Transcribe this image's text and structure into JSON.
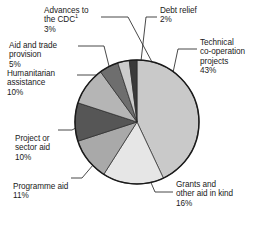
{
  "figure": {
    "background": "#ffffff",
    "outline_color": "#1a1a1a",
    "leader_color": "#1a1a1a"
  },
  "chart_data": {
    "type": "pie",
    "title": "",
    "subtitle": "",
    "xlabel": "",
    "ylabel": "",
    "grid": false,
    "legend_position": "none",
    "label_format": "name + percent",
    "start_angle_deg": 0,
    "direction": "clockwise",
    "center": {
      "x": 137,
      "y": 122
    },
    "radius": 62,
    "categories": [
      "Technical co-operation projects",
      "Grants and other aid in kind",
      "Programme aid",
      "Project or sector aid",
      "Humanitarian assistance",
      "Aid and trade provision",
      "Advances to the CDC",
      "Debt relief"
    ],
    "values": [
      43,
      16,
      11,
      10,
      10,
      5,
      3,
      2
    ],
    "value_labels": [
      "43%",
      "16%",
      "11%",
      "10%",
      "10%",
      "5%",
      "3%",
      "2%"
    ],
    "colors": [
      "#c9c9c9",
      "#e6e6e6",
      "#a9a9a9",
      "#565656",
      "#b5b5b5",
      "#6e6e6e",
      "#cccccc",
      "#3a3a3a"
    ],
    "total": 100,
    "slices": [
      {
        "name": "Technical co-operation projects",
        "value": 43,
        "label": "43%",
        "color": "#c9c9c9"
      },
      {
        "name": "Grants and other aid in kind",
        "value": 16,
        "label": "16%",
        "color": "#e6e6e6"
      },
      {
        "name": "Programme aid",
        "value": 11,
        "label": "11%",
        "color": "#a9a9a9"
      },
      {
        "name": "Project or sector aid",
        "value": 10,
        "label": "10%",
        "color": "#565656"
      },
      {
        "name": "Humanitarian assistance",
        "value": 10,
        "label": "10%",
        "color": "#b5b5b5"
      },
      {
        "name": "Aid and trade provision",
        "value": 5,
        "label": "5%",
        "color": "#6e6e6e"
      },
      {
        "name": "Advances to the CDC",
        "value": 3,
        "label": "3%",
        "color": "#cccccc"
      },
      {
        "name": "Debt relief",
        "value": 2,
        "label": "2%",
        "color": "#3a3a3a"
      }
    ],
    "annotations": [
      {
        "text": "1",
        "kind": "footnote-marker",
        "attached_to": "Advances to the CDC"
      }
    ]
  },
  "labels": {
    "advances": {
      "line1": "Advances to",
      "line2": "the CDC",
      "footnote": "1",
      "pct": "3%"
    },
    "debt_relief": {
      "line1": "Debt relief",
      "pct": "2%"
    },
    "technical": {
      "line1": "Technical",
      "line2": "co-operation",
      "line3": "projects",
      "pct": "43%"
    },
    "aid_and_trade": {
      "line1": "Aid and trade",
      "line2": "provision",
      "pct": "5%"
    },
    "humanitarian": {
      "line1": "Humanitarian",
      "line2": "assistance",
      "pct": "10%"
    },
    "project_sector": {
      "line1": "Project or",
      "line2": "sector aid",
      "pct": "10%"
    },
    "programme": {
      "line1": "Programme aid",
      "pct": "11%"
    },
    "grants": {
      "line1": "Grants and",
      "line2": "other aid in kind",
      "pct": "16%"
    }
  }
}
